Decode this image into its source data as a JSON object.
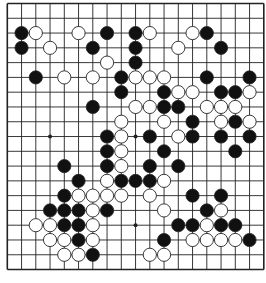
{
  "diagram": {
    "type": "go-board",
    "size": 19,
    "colors": {
      "line": "#222222",
      "black_stone": "#111111",
      "white_stone": "#ffffff",
      "stone_outline": "#222222",
      "background": "#ffffff"
    },
    "geometry": {
      "origin_x": 7.3,
      "origin_y": 3.5,
      "step_x": 14.25,
      "step_y": 14.78,
      "stone_radius": 6.6
    },
    "star_points": [
      [
        3,
        9
      ],
      [
        9,
        9
      ],
      [
        9,
        15
      ]
    ],
    "stones": {
      "black": [
        [
          1,
          2
        ],
        [
          7,
          2
        ],
        [
          9,
          2
        ],
        [
          14,
          2
        ],
        [
          1,
          3
        ],
        [
          6,
          3
        ],
        [
          9,
          3
        ],
        [
          15,
          3
        ],
        [
          9,
          4
        ],
        [
          2,
          5
        ],
        [
          8,
          5
        ],
        [
          14,
          5
        ],
        [
          17,
          5
        ],
        [
          8,
          6
        ],
        [
          11,
          6
        ],
        [
          15,
          6
        ],
        [
          16,
          6
        ],
        [
          6,
          7
        ],
        [
          11,
          7
        ],
        [
          12,
          7
        ],
        [
          13,
          8
        ],
        [
          16,
          8
        ],
        [
          7,
          9
        ],
        [
          10,
          9
        ],
        [
          13,
          9
        ],
        [
          15,
          9
        ],
        [
          17,
          9
        ],
        [
          7,
          10
        ],
        [
          11,
          10
        ],
        [
          16,
          10
        ],
        [
          4,
          11
        ],
        [
          7,
          11
        ],
        [
          10,
          11
        ],
        [
          12,
          11
        ],
        [
          5,
          12
        ],
        [
          8,
          12
        ],
        [
          9,
          12
        ],
        [
          10,
          12
        ],
        [
          4,
          13
        ],
        [
          13,
          13
        ],
        [
          15,
          13
        ],
        [
          3,
          14
        ],
        [
          4,
          14
        ],
        [
          5,
          14
        ],
        [
          7,
          14
        ],
        [
          14,
          14
        ],
        [
          4,
          15
        ],
        [
          5,
          15
        ],
        [
          12,
          15
        ],
        [
          13,
          15
        ],
        [
          15,
          15
        ],
        [
          16,
          15
        ],
        [
          5,
          16
        ],
        [
          11,
          16
        ],
        [
          17,
          16
        ],
        [
          6,
          17
        ]
      ],
      "white": [
        [
          2,
          2
        ],
        [
          5,
          2
        ],
        [
          10,
          2
        ],
        [
          13,
          2
        ],
        [
          3,
          3
        ],
        [
          12,
          3
        ],
        [
          7,
          4
        ],
        [
          4,
          5
        ],
        [
          6,
          5
        ],
        [
          9,
          5
        ],
        [
          10,
          5
        ],
        [
          11,
          5
        ],
        [
          12,
          6
        ],
        [
          13,
          6
        ],
        [
          17,
          6
        ],
        [
          9,
          7
        ],
        [
          10,
          7
        ],
        [
          14,
          7
        ],
        [
          15,
          7
        ],
        [
          16,
          7
        ],
        [
          8,
          8
        ],
        [
          11,
          8
        ],
        [
          15,
          8
        ],
        [
          17,
          8
        ],
        [
          8,
          9
        ],
        [
          12,
          9
        ],
        [
          8,
          10
        ],
        [
          8,
          11
        ],
        [
          7,
          12
        ],
        [
          11,
          12
        ],
        [
          5,
          13
        ],
        [
          6,
          13
        ],
        [
          7,
          13
        ],
        [
          8,
          13
        ],
        [
          10,
          13
        ],
        [
          6,
          14
        ],
        [
          11,
          14
        ],
        [
          15,
          14
        ],
        [
          2,
          15
        ],
        [
          3,
          15
        ],
        [
          6,
          15
        ],
        [
          14,
          15
        ],
        [
          3,
          16
        ],
        [
          4,
          16
        ],
        [
          6,
          16
        ],
        [
          13,
          16
        ],
        [
          14,
          16
        ],
        [
          15,
          16
        ],
        [
          16,
          16
        ],
        [
          4,
          17
        ],
        [
          5,
          17
        ],
        [
          10,
          17
        ],
        [
          11,
          17
        ]
      ]
    }
  }
}
